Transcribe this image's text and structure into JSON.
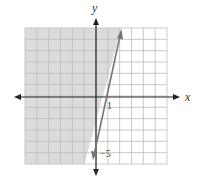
{
  "chart_data": {
    "type": "line",
    "title": "",
    "xlabel": "x",
    "ylabel": "y",
    "xlim": [
      -6,
      6
    ],
    "ylim": [
      -6,
      6
    ],
    "grid": true,
    "series": [
      {
        "name": "boundary line",
        "equation": "y = 5x - 5",
        "x": [
          0,
          1,
          2.1
        ],
        "y": [
          -5,
          0,
          5.7
        ],
        "style": "solid"
      }
    ],
    "shaded_region": "left of / above the line y = 5x - 5",
    "annotations": [
      {
        "text": "1",
        "x": 1,
        "y": 0
      },
      {
        "text": "-5",
        "x": 0,
        "y": -5
      }
    ]
  },
  "labels": {
    "x_axis": "x",
    "y_axis": "y",
    "x_intercept": "1",
    "y_intercept": "−5"
  },
  "colors": {
    "shade": "#dcdcdc",
    "grid": "#bdbdbd",
    "axis": "#222222",
    "line": "#777777"
  }
}
